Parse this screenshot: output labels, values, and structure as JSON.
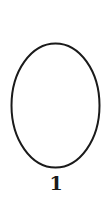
{
  "figure": {
    "shape": "ellipse",
    "label": "1",
    "stroke_color": "#1a1a1a",
    "fill_color": "#ffffff",
    "ellipse": {
      "cx": 55.5,
      "cy": 105.5,
      "rx": 44,
      "ry": 62,
      "stroke_width": 2
    }
  }
}
